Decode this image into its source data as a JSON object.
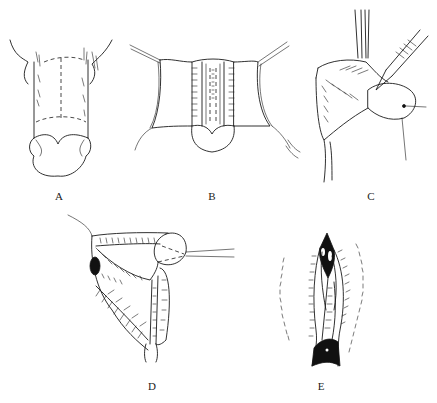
{
  "figure": {
    "panels": [
      {
        "id": "A",
        "label": "A",
        "description": "Dorsal view of penis shaft with dashed incision outline"
      },
      {
        "id": "B",
        "label": "B",
        "description": "Skin flaps retracted with stay sutures exposing central strip"
      },
      {
        "id": "C",
        "label": "C",
        "description": "Lateral view with forceps and scalpel dissecting skin"
      },
      {
        "id": "D",
        "label": "D",
        "description": "Lateral view with glans retracted by suture, hatched flaps"
      },
      {
        "id": "E",
        "label": "E",
        "description": "Closed reconstruction with sutured edges and dark regions"
      }
    ],
    "colors": {
      "line": "#1a1a1a",
      "background": "#ffffff"
    }
  }
}
